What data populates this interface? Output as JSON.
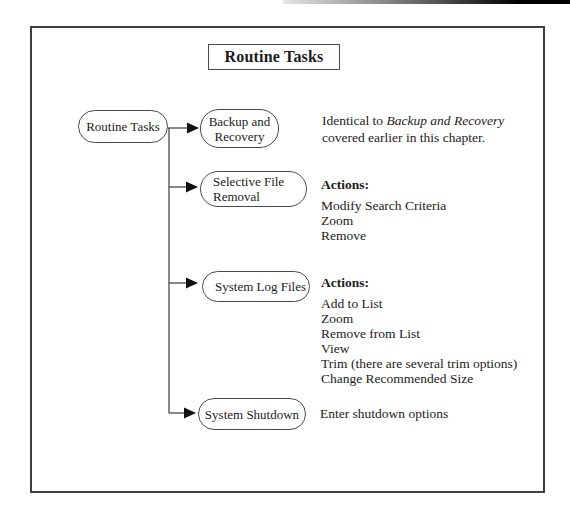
{
  "title_box": {
    "label": "Routine Tasks"
  },
  "tree": {
    "root": {
      "label": "Routine Tasks"
    },
    "rows": [
      {
        "node_label": "Backup and\nRecovery",
        "desc_prefix": "Identical to ",
        "desc_italic": "Backup and Recovery",
        "desc_line2": "covered earlier in this chapter."
      },
      {
        "node_label": "Selective File\nRemoval",
        "actions_heading": "Actions:",
        "actions": [
          "Modify Search Criteria",
          "Zoom",
          "Remove"
        ]
      },
      {
        "node_label": "System Log Files",
        "actions_heading": "Actions:",
        "actions": [
          "Add to List",
          "Zoom",
          "Remove from List",
          "View",
          "Trim (there are several trim options)",
          "Change Recommended Size"
        ]
      },
      {
        "node_label": "System Shutdown",
        "desc_plain": "Enter shutdown options"
      }
    ]
  }
}
